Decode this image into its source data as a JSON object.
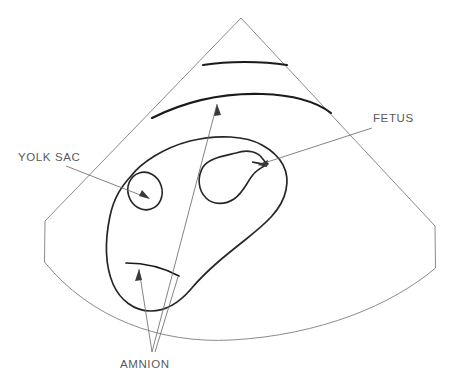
{
  "figure": {
    "kind": "ultrasound-sector-line-drawing",
    "background_color": "#ffffff",
    "outline_color": "#8b8b8b",
    "structure_color": "#1a1a1a",
    "label_color": "#5a5a5a",
    "leader_color": "#6e6e6e"
  },
  "labels": [
    {
      "id": "fetus",
      "text": "FETUS",
      "x": 373,
      "y": 122,
      "anchor": "start"
    },
    {
      "id": "yolk-sac",
      "text": "YOLK SAC",
      "x": 18,
      "y": 161,
      "anchor": "start"
    },
    {
      "id": "amnion",
      "text": "AMNION",
      "x": 120,
      "y": 368,
      "anchor": "start"
    }
  ],
  "annotations": {
    "fetus_leader_note": "leader from FETUS label down-left to fetal head",
    "yolk_leader_note": "leader from YOLK SAC label right-down to yolk sac vesicle",
    "amnion_leader_note": "two leaders converge below and point up to amnion membranes"
  }
}
